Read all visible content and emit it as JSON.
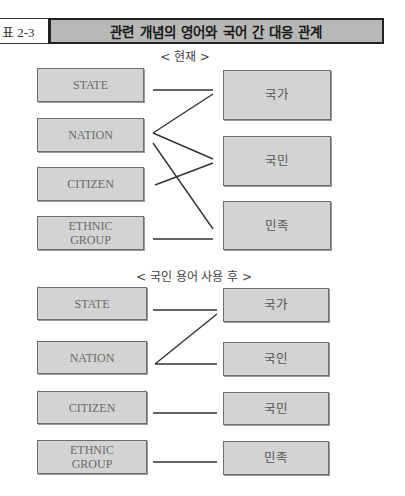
{
  "header": {
    "label": "표 2-3",
    "title": "관련 개념의 영어와 국어 간 대응 관계"
  },
  "sections": [
    {
      "subtitle": "< 현재 >",
      "left": [
        "STATE",
        "NATION",
        "CITIZEN",
        "ETHNIC\nGROUP"
      ],
      "right": [
        "국가",
        "국민",
        "민족"
      ],
      "connections": [
        {
          "from": "STATE",
          "to": "국가"
        },
        {
          "from": "NATION",
          "to": "국가"
        },
        {
          "from": "NATION",
          "to": "국민"
        },
        {
          "from": "NATION",
          "to": "민족"
        },
        {
          "from": "CITIZEN",
          "to": "국민"
        },
        {
          "from": "ETHNIC GROUP",
          "to": "민족"
        }
      ]
    },
    {
      "subtitle": "< 국인 용어 사용 후 >",
      "left": [
        "STATE",
        "NATION",
        "CITIZEN",
        "ETHNIC\nGROUP"
      ],
      "right": [
        "국가",
        "국인",
        "국민",
        "민족"
      ],
      "connections": [
        {
          "from": "STATE",
          "to": "국가"
        },
        {
          "from": "NATION",
          "to": "국가"
        },
        {
          "from": "NATION",
          "to": "국인"
        },
        {
          "from": "CITIZEN",
          "to": "국민"
        },
        {
          "from": "ETHNIC GROUP",
          "to": "민족"
        }
      ]
    }
  ],
  "colors": {
    "box_fill": "#d3d3d3",
    "box_border": "#6e6e6e",
    "header_fill": "#b8b8b8",
    "line": "#333333"
  }
}
